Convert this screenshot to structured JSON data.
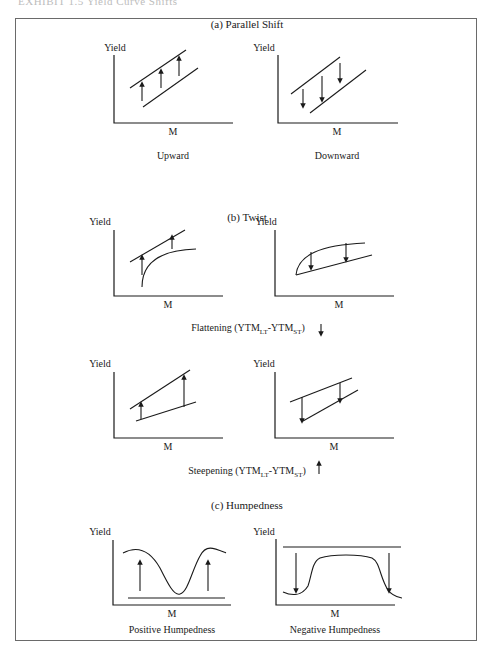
{
  "header": {
    "caption": "EXHIBIT 1.5 Yield Curve Shifts"
  },
  "sections": {
    "parallel": {
      "title": "(a) Parallel Shift",
      "left": {
        "y_label": "Yield",
        "x_label": "M",
        "caption": "Upward"
      },
      "right": {
        "y_label": "Yield",
        "x_label": "M",
        "caption": "Downward"
      }
    },
    "twist": {
      "title": "(b) Twist",
      "row1": {
        "left": {
          "y_label": "Yield",
          "x_label": "M"
        },
        "right": {
          "y_label": "Yield",
          "x_label": "M"
        },
        "caption_prefix": "Flattening (YTM",
        "caption_sub1": "LT",
        "caption_mid": "-YTM",
        "caption_sub2": "ST",
        "caption_suffix": ")",
        "caption_arrow": "down-arrow"
      },
      "row2": {
        "left": {
          "y_label": "Yield",
          "x_label": "M"
        },
        "right": {
          "y_label": "Yield",
          "x_label": "M"
        },
        "caption_prefix": "Steepening (YTM",
        "caption_sub1": "LT",
        "caption_mid": "-YTM",
        "caption_sub2": "ST",
        "caption_suffix": ")",
        "caption_arrow": "up-arrow"
      }
    },
    "humpedness": {
      "title": "(c) Humpedness",
      "left": {
        "y_label": "Yield",
        "x_label": "M",
        "caption": "Positive Humpedness"
      },
      "right": {
        "y_label": "Yield",
        "x_label": "M",
        "caption": "Negative Humpedness"
      }
    }
  },
  "colors": {
    "ink": "#1a1a1a",
    "frame": "#6a6a6a",
    "background": "#ffffff"
  }
}
